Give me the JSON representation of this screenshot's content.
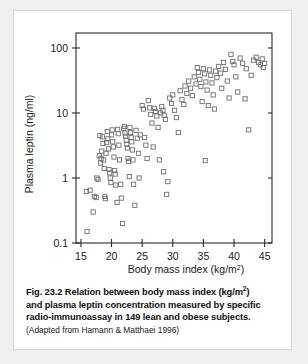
{
  "figure": {
    "caption_lines": [
      "Fig. 23.2    Relation between body mass index (kg/m",
      "and plasma leptin concentration measured by specific",
      "radio-immunoassay in 149 lean and obese subjects."
    ],
    "caption_sup": "2",
    "caption_sup_tail": ")",
    "source_note": "(Adapted from Hamann & Matthaei 1996)"
  },
  "chart_data": {
    "type": "scatter",
    "title": "",
    "xlabel": "Body mass index (kg/m",
    "xlabel_sup": "2",
    "xlabel_tail": ")",
    "ylabel": "Plasma leptin (ng/ml)",
    "xlim": [
      14.2,
      46.2
    ],
    "ylim": [
      0.1,
      170
    ],
    "yscale": "log",
    "xticks": [
      15,
      20,
      25,
      30,
      35,
      40,
      45
    ],
    "xticklabels": [
      "15",
      "20",
      "25",
      "30",
      "35",
      "40",
      "45"
    ],
    "yticks": [
      0.1,
      1,
      10,
      100
    ],
    "yticklabels": [
      "0.1",
      "1",
      "10",
      "100"
    ],
    "grid": false,
    "legend": null,
    "marker": "open-square",
    "marker_color": "#6e6e74",
    "n_points": 149,
    "x": [
      15.9,
      16.0,
      16.5,
      17.0,
      17.2,
      17.5,
      17.6,
      17.8,
      18.0,
      18.1,
      18.2,
      18.3,
      18.4,
      18.5,
      18.6,
      18.7,
      18.8,
      18.9,
      19.0,
      19.1,
      19.2,
      19.3,
      19.4,
      19.5,
      19.6,
      19.7,
      19.8,
      19.9,
      20.0,
      20.1,
      20.2,
      20.3,
      20.4,
      20.5,
      20.6,
      20.7,
      20.9,
      21.0,
      21.1,
      21.2,
      21.3,
      21.5,
      21.6,
      21.8,
      22.0,
      22.1,
      22.2,
      22.3,
      22.4,
      22.5,
      22.6,
      22.7,
      22.8,
      22.9,
      23.0,
      23.1,
      23.2,
      23.3,
      23.4,
      23.5,
      23.6,
      23.8,
      24.0,
      24.2,
      24.4,
      24.5,
      24.7,
      25.0,
      25.2,
      25.4,
      25.6,
      25.8,
      26.0,
      26.2,
      26.4,
      26.6,
      26.8,
      27.0,
      27.2,
      27.4,
      27.6,
      27.8,
      28.0,
      28.2,
      28.4,
      28.6,
      28.8,
      29.0,
      29.2,
      29.5,
      29.8,
      30.0,
      30.3,
      30.6,
      30.9,
      31.2,
      31.5,
      31.8,
      32.0,
      32.3,
      32.6,
      32.9,
      33.2,
      33.5,
      33.8,
      34.0,
      34.2,
      34.4,
      34.6,
      34.8,
      35.0,
      35.2,
      35.4,
      35.6,
      35.8,
      36.0,
      36.2,
      36.4,
      36.6,
      36.8,
      37.0,
      37.2,
      37.5,
      37.8,
      38.0,
      38.3,
      38.6,
      38.9,
      39.2,
      39.5,
      39.8,
      40.0,
      40.3,
      40.6,
      41.0,
      41.4,
      41.8,
      42.0,
      42.4,
      42.8,
      43.2,
      43.6,
      44.0,
      44.3,
      44.6,
      44.8,
      45.0,
      35.3,
      28.5
    ],
    "y": [
      0.62,
      0.15,
      0.65,
      0.3,
      0.52,
      0.5,
      1.0,
      0.95,
      2.2,
      4.5,
      1.7,
      2.0,
      2.6,
      4.3,
      3.4,
      1.9,
      1.4,
      0.52,
      0.48,
      2.4,
      3.5,
      5.2,
      4.0,
      2.8,
      1.35,
      1.2,
      1.0,
      0.85,
      4.6,
      5.5,
      3.6,
      3.0,
      2.1,
      1.3,
      1.15,
      0.78,
      0.42,
      5.6,
      4.8,
      3.2,
      1.9,
      0.8,
      0.49,
      0.2,
      5.8,
      6.2,
      4.9,
      4.4,
      3.8,
      3.3,
      2.9,
      2.0,
      1.8,
      1.05,
      6.0,
      5.0,
      4.2,
      3.6,
      2.7,
      1.9,
      0.8,
      0.38,
      5.4,
      4.1,
      2.4,
      1.0,
      4.6,
      13.0,
      11.5,
      4.2,
      3.2,
      2.0,
      15.5,
      12.0,
      9.5,
      7.0,
      3.0,
      11.8,
      10.5,
      9.0,
      6.0,
      1.9,
      10.0,
      12.5,
      11.0,
      9.2,
      8.0,
      0.56,
      0.88,
      17.0,
      14.0,
      19.0,
      11.0,
      8.5,
      5.0,
      22.0,
      16.0,
      13.5,
      26.0,
      20.0,
      31.0,
      24.0,
      18.5,
      36.0,
      28.0,
      50.0,
      42.0,
      33.0,
      25.5,
      15.0,
      48.0,
      40.0,
      30.0,
      22.5,
      13.0,
      46.0,
      38.0,
      29.0,
      19.0,
      11.5,
      44.0,
      35.0,
      52.0,
      41.0,
      24.0,
      60.0,
      47.0,
      31.0,
      17.0,
      80.0,
      62.0,
      55.0,
      36.0,
      21.0,
      70.0,
      58.0,
      16.5,
      48.0,
      5.5,
      38.0,
      65.0,
      72.0,
      60.0,
      55.0,
      68.0,
      50.0,
      58.0,
      1.85,
      1.25
    ]
  }
}
